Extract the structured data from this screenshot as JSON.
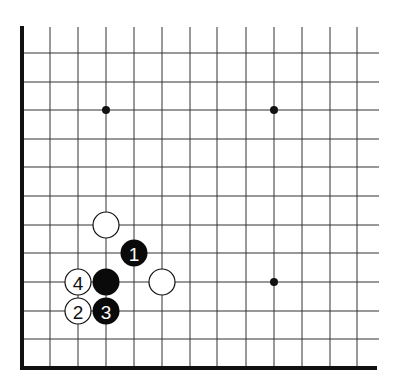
{
  "diagram": {
    "type": "go-board-corner",
    "edges": [
      "left",
      "bottom"
    ],
    "grid": {
      "x_lines": [
        22,
        50,
        78,
        106,
        134,
        162,
        190,
        217,
        246,
        274,
        302,
        330,
        357
      ],
      "y_lines": [
        53,
        82,
        110,
        139,
        167,
        196,
        225,
        253,
        282,
        311,
        339,
        368
      ],
      "top_y": 27,
      "right_x": 379
    },
    "star_points": [
      {
        "col": 3,
        "row": 2
      },
      {
        "col": 9,
        "row": 2
      },
      {
        "col": 9,
        "row": 8
      }
    ],
    "stones": [
      {
        "color": "white",
        "col": 3,
        "row": 6,
        "label": ""
      },
      {
        "color": "black",
        "col": 4,
        "row": 7,
        "label": "1"
      },
      {
        "color": "black",
        "col": 3,
        "row": 8,
        "label": ""
      },
      {
        "color": "white",
        "col": 2,
        "row": 8,
        "label": "4"
      },
      {
        "color": "white",
        "col": 5,
        "row": 8,
        "label": ""
      },
      {
        "color": "white",
        "col": 2,
        "row": 9,
        "label": "2"
      },
      {
        "color": "black",
        "col": 3,
        "row": 9,
        "label": "3"
      }
    ],
    "colors": {
      "line": "#333333",
      "edge": "#111111",
      "black_stone": "#0a0a0a",
      "white_stone": "#ffffff",
      "background": "#ffffff"
    }
  }
}
